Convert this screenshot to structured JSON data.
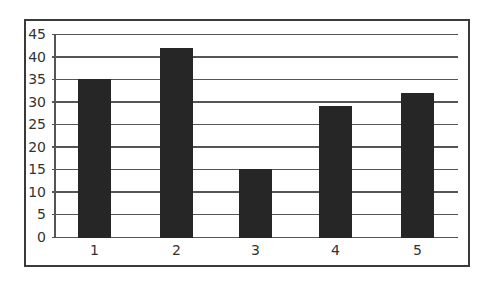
{
  "chart_data": {
    "type": "bar",
    "title": "",
    "xlabel": "",
    "ylabel": "",
    "categories": [
      "1",
      "2",
      "3",
      "4",
      "5"
    ],
    "values": [
      35,
      42,
      15,
      29,
      32
    ],
    "ylim": [
      0,
      45
    ],
    "yticks": [
      "0",
      "5",
      "10",
      "15",
      "20",
      "25",
      "30",
      "35",
      "40",
      "45"
    ],
    "grid": true,
    "legend": null,
    "bar_color": "#262626",
    "grid_color": "#555555"
  }
}
